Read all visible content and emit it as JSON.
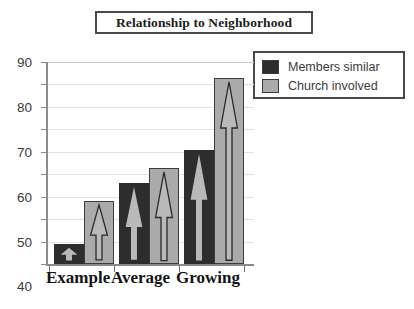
{
  "title": "Relationship to Neighborhood",
  "legend": {
    "entries": [
      {
        "label": "Members  similar",
        "color": "#2d2d2d",
        "icon": "dark-square-swatch"
      },
      {
        "label": "Church  involved",
        "color": "#aaaaaa",
        "icon": "gray-square-swatch"
      }
    ]
  },
  "axis": {
    "y_ticks": [
      "0",
      "10",
      "20",
      "30",
      "40",
      "50",
      "60",
      "70",
      "80",
      "90"
    ],
    "x_labels": [
      "Example",
      "Average",
      "Growing"
    ]
  },
  "chart_data": {
    "type": "bar",
    "title": "Relationship to Neighborhood",
    "xlabel": "",
    "ylabel": "",
    "ylim": [
      0,
      90
    ],
    "ytick_step": 10,
    "grid": true,
    "legend_position": "top-right",
    "categories": [
      "Example",
      "Average",
      "Growing"
    ],
    "series": [
      {
        "name": "Members  similar",
        "color": "#2d2d2d",
        "values": [
          9,
          36,
          51
        ]
      },
      {
        "name": "Church  involved",
        "color": "#aaaaaa",
        "values": [
          28,
          43,
          83
        ]
      }
    ],
    "annotations": [
      {
        "type": "arrow-overlay",
        "description": "upward arrow drawn inside each bar"
      }
    ]
  }
}
